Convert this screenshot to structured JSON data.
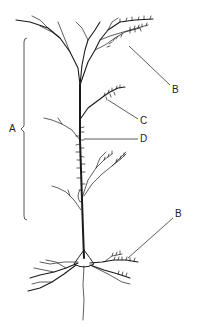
{
  "figure": {
    "labels": {
      "A": "A",
      "B_apical": "B",
      "C": "C",
      "D": "D",
      "B_basal": "B"
    },
    "colors": {
      "ink": "#1a1a1a",
      "background": "#ffffff"
    }
  }
}
